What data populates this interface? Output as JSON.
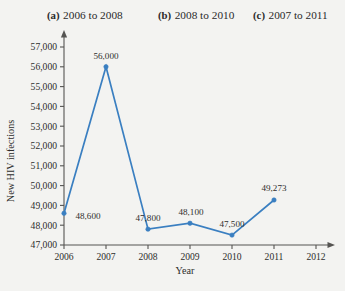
{
  "partial_top_line": "",
  "choices": [
    {
      "tag": "(a)",
      "label": "2006 to 2008"
    },
    {
      "tag": "(b)",
      "label": "2008 to 2010"
    },
    {
      "tag": "(c)",
      "label": "2007 to 2011"
    }
  ],
  "chart_data": {
    "type": "line",
    "title": "",
    "xlabel": "Year",
    "ylabel": "New HIV infections",
    "x": [
      2006,
      2007,
      2008,
      2009,
      2010,
      2011
    ],
    "values": [
      48600,
      56000,
      47800,
      48100,
      47500,
      49273
    ],
    "point_labels": [
      "48,600",
      "56,000",
      "47,800",
      "48,100",
      "47,500",
      "49,273"
    ],
    "xtick_labels": [
      "2006",
      "2007",
      "2008",
      "2009",
      "2010",
      "2011",
      "2012"
    ],
    "xticks": [
      2006,
      2007,
      2008,
      2009,
      2010,
      2011,
      2012
    ],
    "ytick_labels": [
      "57,000",
      "56,000",
      "55,000",
      "54,000",
      "53,000",
      "52,000",
      "51,000",
      "50,000",
      "49,000",
      "48,000",
      "47,000"
    ],
    "yticks": [
      57000,
      56000,
      55000,
      54000,
      53000,
      52000,
      51000,
      50000,
      49000,
      48000,
      47000
    ],
    "xlim": [
      2006,
      2012
    ],
    "ylim": [
      47000,
      57000
    ],
    "grid": false,
    "legend": "none",
    "series_color": "#3a7fc1",
    "axis_color": "#555452",
    "marker": "circle"
  }
}
